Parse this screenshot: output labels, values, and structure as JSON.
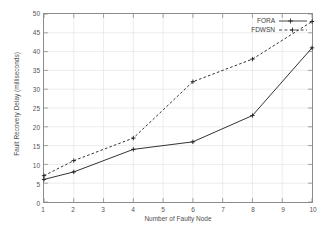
{
  "chart_data": {
    "type": "line",
    "title": "",
    "xlabel": "Number of Faulty Node",
    "ylabel": "Fault Recovery Delay (milliseconds)",
    "xlim": [
      1,
      10
    ],
    "ylim": [
      0,
      50
    ],
    "xticks": [
      1,
      2,
      3,
      4,
      5,
      6,
      7,
      8,
      9,
      10
    ],
    "yticks": [
      0,
      5,
      10,
      15,
      20,
      25,
      30,
      35,
      40,
      45,
      50
    ],
    "grid": true,
    "legend_position": "top-right-inside",
    "x": [
      1,
      2,
      4,
      6,
      8,
      10
    ],
    "series": [
      {
        "name": "FORA",
        "style": "solid",
        "marker": "plus",
        "color": "#1a1a1a",
        "x": [
          1,
          2,
          4,
          6,
          8,
          10
        ],
        "values": [
          6,
          8,
          14,
          16,
          23,
          41
        ]
      },
      {
        "name": "FDWSN",
        "style": "dashed",
        "marker": "plus",
        "color": "#1a1a1a",
        "x": [
          1,
          2,
          4,
          6,
          8,
          10
        ],
        "values": [
          7,
          11,
          17,
          32,
          38,
          48
        ]
      }
    ]
  },
  "axes": {
    "xlabel": "Number of Faulty Node",
    "ylabel": "Fault Recovery Delay (milliseconds)",
    "xticks": [
      "1",
      "2",
      "3",
      "4",
      "5",
      "6",
      "7",
      "8",
      "9",
      "10"
    ],
    "yticks": [
      "0",
      "5",
      "10",
      "15",
      "20",
      "25",
      "30",
      "35",
      "40",
      "45",
      "50"
    ]
  },
  "legend": {
    "entries": [
      {
        "label": "FORA",
        "style": "solid"
      },
      {
        "label": "FDWSN",
        "style": "dashed"
      }
    ]
  },
  "colors": {
    "background": "#ffffff",
    "frame": "#8c8c8c",
    "grid": "#e4e4e4",
    "line": "#1a1a1a",
    "text": "#4f4f4f"
  }
}
